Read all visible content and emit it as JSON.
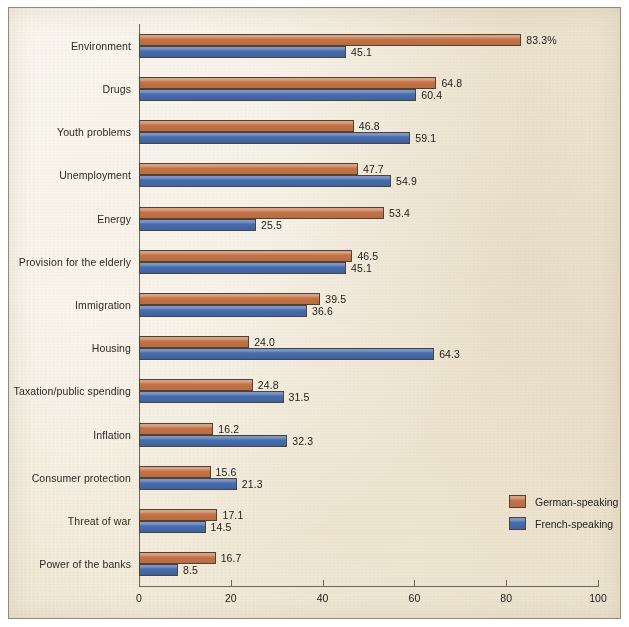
{
  "chart_data": {
    "type": "bar",
    "orientation": "horizontal",
    "title": "",
    "xlabel": "",
    "ylabel": "",
    "xlim": [
      0,
      100
    ],
    "xticks": [
      "0",
      "20",
      "40",
      "60",
      "80",
      "100"
    ],
    "grid": false,
    "legend_position": "inside-lower-right",
    "categories": [
      "Environment",
      "Drugs",
      "Youth problems",
      "Unemployment",
      "Energy",
      "Provision for the elderly",
      "Immigration",
      "Housing",
      "Taxation/public spending",
      "Inflation",
      "Consumer protection",
      "Threat of war",
      "Power of the banks"
    ],
    "series": [
      {
        "name": "German-speaking",
        "color": "#c9784c",
        "values": [
          83.3,
          64.8,
          46.8,
          47.7,
          53.4,
          46.5,
          39.5,
          24.0,
          24.8,
          16.2,
          15.6,
          17.1,
          16.7
        ],
        "labels": [
          "83.3%",
          "64.8",
          "46.8",
          "47.7",
          "53.4",
          "46.5",
          "39.5",
          "24.0",
          "24.8",
          "16.2",
          "15.6",
          "17.1",
          "16.7"
        ]
      },
      {
        "name": "French-speaking",
        "color": "#4d72b2",
        "values": [
          45.1,
          60.4,
          59.1,
          54.9,
          25.5,
          45.1,
          36.6,
          64.3,
          31.5,
          32.3,
          21.3,
          14.5,
          8.5
        ],
        "labels": [
          "45.1",
          "60.4",
          "59.1",
          "54.9",
          "25.5",
          "45.1",
          "36.6",
          "64.3",
          "31.5",
          "32.3",
          "21.3",
          "14.5",
          "8.5"
        ]
      }
    ]
  },
  "legend": {
    "items": [
      {
        "label": "German-speaking",
        "color": "#c9784c"
      },
      {
        "label": "French-speaking",
        "color": "#4d72b2"
      }
    ]
  }
}
